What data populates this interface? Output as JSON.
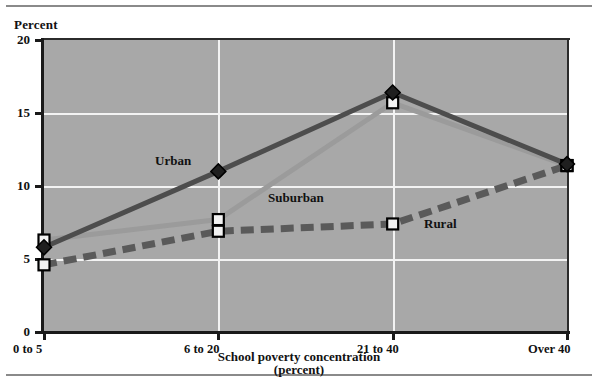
{
  "chart_data": {
    "type": "line",
    "title": "",
    "subtitle": "",
    "ylabel": "Percent",
    "xlabel": "School poverty concentration",
    "xlabel_sub": "(percent)",
    "categories": [
      "0 to 5",
      "6 to 20",
      "21 to 40",
      "Over 40"
    ],
    "ylim": [
      0,
      20
    ],
    "yticks": [
      0,
      5,
      10,
      15,
      20
    ],
    "ytick_labels": [
      "0",
      "5",
      "10",
      "15",
      "20"
    ],
    "grid": "white gridlines on gray plot area",
    "legend_position": "inline labels next to lines",
    "series": [
      {
        "name": "Urban",
        "values": [
          5.8,
          11.0,
          16.4,
          11.5
        ],
        "color": "#4d4d4d",
        "marker": "diamond",
        "dash": "solid"
      },
      {
        "name": "Suburban",
        "values": [
          6.3,
          7.7,
          15.7,
          11.4
        ],
        "color": "#9b9b9b",
        "marker": "square-open",
        "dash": "solid"
      },
      {
        "name": "Rural",
        "values": [
          4.6,
          6.9,
          7.4,
          11.4
        ],
        "color": "#5a5a5a",
        "marker": "square-open",
        "dash": "dashed"
      }
    ],
    "annotations": [
      {
        "text": "Urban",
        "x": 155,
        "y": 153
      },
      {
        "text": "Suburban",
        "x": 268,
        "y": 190
      },
      {
        "text": "Rural",
        "x": 424,
        "y": 216
      }
    ],
    "colors": {
      "plot_background": "#a8a8a8",
      "gridline": "#f3f3f3",
      "axis": "#1a1a1a",
      "text": "#111111",
      "page_background": "#ffffff",
      "rule": "#8a8a8a"
    }
  }
}
